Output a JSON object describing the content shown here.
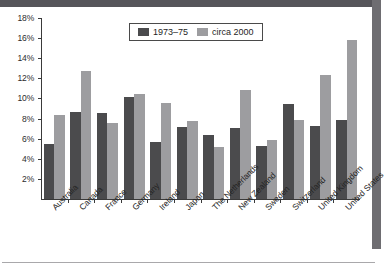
{
  "chart_data": {
    "type": "bar",
    "title": "",
    "xlabel": "",
    "ylabel": "",
    "ylim": [
      0,
      18
    ],
    "ytick_values": [
      2,
      4,
      6,
      8,
      10,
      12,
      14,
      16,
      18
    ],
    "ytick_labels": [
      "2%",
      "4%",
      "6%",
      "8%",
      "10%",
      "12%",
      "14%",
      "16%",
      "18%"
    ],
    "grid": false,
    "legend_position": "top-center",
    "categories": [
      "Australia",
      "Canada",
      "France",
      "Germany",
      "Ireland",
      "Japan",
      "The Netherlands",
      "New Zealand",
      "Sweden",
      "Switzerland",
      "United Kingdom",
      "United States"
    ],
    "series": [
      {
        "name": "1973–75",
        "color": "#4b4b4d",
        "values": [
          5.5,
          8.7,
          8.6,
          10.1,
          5.7,
          7.2,
          6.4,
          7.1,
          5.3,
          9.4,
          7.3,
          7.9
        ]
      },
      {
        "name": "circa 2000",
        "color": "#9d9da0",
        "values": [
          8.4,
          12.7,
          7.6,
          10.4,
          9.5,
          7.8,
          5.2,
          10.8,
          5.9,
          7.9,
          12.3,
          15.8
        ]
      }
    ]
  },
  "legend": {
    "entries": [
      {
        "label": "1973–75"
      },
      {
        "label": "circa 2000"
      }
    ]
  }
}
